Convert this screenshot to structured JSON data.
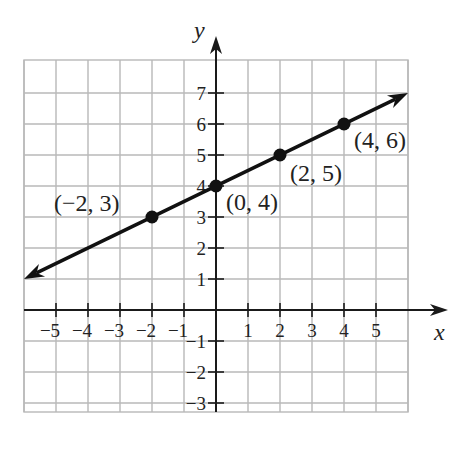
{
  "chart_data": {
    "type": "line",
    "title": "",
    "xlabel": "x",
    "ylabel": "y",
    "xlim": [
      -6,
      6
    ],
    "ylim": [
      -3.3,
      7.9
    ],
    "grid": true,
    "x_ticks": [
      -5,
      -4,
      -3,
      -2,
      -1,
      1,
      2,
      3,
      4,
      5
    ],
    "y_ticks": [
      -3,
      -2,
      -1,
      1,
      2,
      3,
      4,
      5,
      6,
      7
    ],
    "x_tick_labels": [
      "−5",
      "−4",
      "−3",
      "−2",
      "−1",
      "1",
      "2",
      "3",
      "4",
      "5"
    ],
    "y_tick_labels": [
      "−3",
      "−2",
      "−1",
      "1",
      "2",
      "3",
      "4",
      "5",
      "6",
      "7"
    ],
    "series": [
      {
        "name": "line",
        "equation": "y = x/2 + 4",
        "line_from": [
          -6,
          1
        ],
        "line_to": [
          6,
          7
        ],
        "arrows_both_ends": true,
        "points": [
          {
            "x": -2,
            "y": 3,
            "label": "(−2, 3)"
          },
          {
            "x": 0,
            "y": 4,
            "label": "(0, 4)"
          },
          {
            "x": 2,
            "y": 5,
            "label": "(2, 5)"
          },
          {
            "x": 4,
            "y": 6,
            "label": "(4, 6)"
          }
        ]
      }
    ]
  },
  "colors": {
    "grid": "#b8b8b8",
    "axis": "#1a1a1a",
    "line": "#111111",
    "text": "#222222"
  },
  "layout": {
    "origin_px": [
      216,
      310
    ],
    "x_unit_px": 32,
    "y_unit_px": 31,
    "grid_left_px": 24,
    "grid_right_px": 408,
    "grid_top_px": 60,
    "grid_bottom_px": 412,
    "x_axis_end_px": 448,
    "y_axis_top_px": 36
  }
}
